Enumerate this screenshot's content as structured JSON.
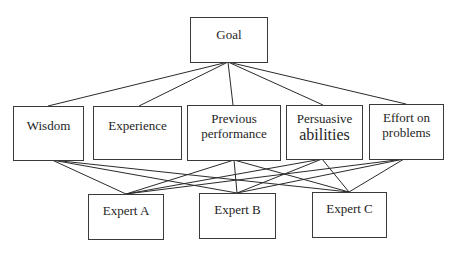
{
  "diagram": {
    "type": "hierarchy",
    "goal": {
      "label": "Goal"
    },
    "criteria": [
      {
        "id": "wisdom",
        "lines": [
          "Wisdom"
        ]
      },
      {
        "id": "experience",
        "lines": [
          "Experience"
        ]
      },
      {
        "id": "previous",
        "lines": [
          "Previous",
          "performance"
        ]
      },
      {
        "id": "persuasive",
        "lines": [
          "Persuasive",
          "abilities"
        ]
      },
      {
        "id": "effort",
        "lines": [
          "Effort on",
          "problems"
        ]
      }
    ],
    "alternatives": [
      {
        "id": "a",
        "label": "Expert A"
      },
      {
        "id": "b",
        "label": "Expert B"
      },
      {
        "id": "c",
        "label": "Expert C"
      }
    ],
    "edges": {
      "goal_to_criteria": [
        "wisdom",
        "experience",
        "previous",
        "persuasive",
        "effort"
      ],
      "criteria_to_alternatives": {
        "wisdom": [
          "a",
          "b",
          "c"
        ],
        "experience": [],
        "previous": [
          "a",
          "b",
          "c"
        ],
        "persuasive": [
          "a",
          "b",
          "c"
        ],
        "effort": [
          "a",
          "b",
          "c"
        ]
      }
    },
    "colors": {
      "line": "#2a2a2a",
      "border": "#3a3a3a",
      "text": "#1e1e1e",
      "background": "#ffffff"
    }
  }
}
